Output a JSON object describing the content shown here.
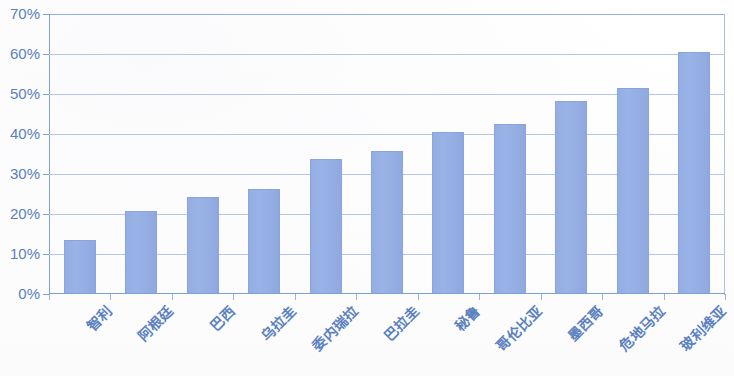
{
  "chart_data": {
    "type": "bar",
    "title": "",
    "subtitle": "",
    "xlabel": "",
    "ylabel": "",
    "categories": [
      "智利",
      "阿根廷",
      "巴西",
      "乌拉圭",
      "委内瑞拉",
      "巴拉圭",
      "秘鲁",
      "哥伦比亚",
      "墨西哥",
      "危地马拉",
      "玻利维亚"
    ],
    "values": [
      13.5,
      20.8,
      24.3,
      26.2,
      33.8,
      35.8,
      40.4,
      42.4,
      48.3,
      51.6,
      60.6
    ],
    "value_unit": "%",
    "ylim": [
      0,
      70
    ],
    "ytick_labels": [
      "0%",
      "10%",
      "20%",
      "30%",
      "40%",
      "50%",
      "60%",
      "70%"
    ],
    "ytick_values": [
      0,
      10,
      20,
      30,
      40,
      50,
      60,
      70
    ],
    "grid": true,
    "legend": "none",
    "series": [
      {
        "name": "",
        "values": [
          13.5,
          20.8,
          24.3,
          26.2,
          33.8,
          35.8,
          40.4,
          42.4,
          48.3,
          51.6,
          60.6
        ]
      }
    ],
    "colors": {
      "bar_fill": "#93aee4",
      "bar_border": "#8aa5dd",
      "gridline": "#b3c8e8",
      "axis": "#7fa0d2",
      "tick_label": "#5b7fbd",
      "category_label": "#5b81c0",
      "background": "#fdfdfd"
    }
  }
}
